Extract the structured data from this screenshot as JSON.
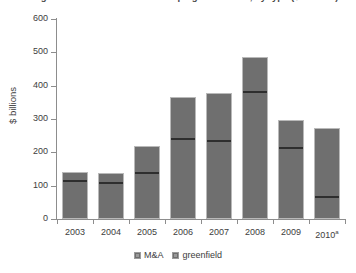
{
  "title": "Foreign direct investment in developing economies, by type ($ billions)",
  "chart_data": {
    "type": "bar",
    "stacked": true,
    "title": "Foreign direct investment in developing economies, by type ($ billions)",
    "xlabel": "",
    "ylabel": "$ billions",
    "ylim": [
      0,
      600
    ],
    "ytick_step": 100,
    "yticks": [
      "600",
      "500",
      "400",
      "300",
      "200",
      "100",
      "0"
    ],
    "grid": false,
    "legend_position": "bottom",
    "categories": [
      "2003",
      "2004",
      "2005",
      "2006",
      "2007",
      "2008",
      "2009",
      "2010"
    ],
    "category_labels": [
      "2003",
      "2004",
      "2005",
      "2006",
      "2007",
      "2008",
      "2009",
      "2010a"
    ],
    "footnote_marker": "a",
    "series": [
      {
        "name": "M&A",
        "color": "#6f6f6f",
        "values": [
          117,
          111,
          141,
          243,
          237,
          384,
          216,
          69
        ]
      },
      {
        "name": "greenfield",
        "color": "#6f6f6f",
        "values": [
          24,
          27,
          78,
          123,
          141,
          102,
          81,
          204
        ]
      }
    ],
    "totals": [
      141,
      138,
      219,
      366,
      378,
      486,
      297,
      273
    ]
  },
  "axis": {
    "y_title": "$ billions"
  },
  "legend": {
    "items": [
      {
        "label": "M&A"
      },
      {
        "label": "greenfield"
      }
    ]
  }
}
